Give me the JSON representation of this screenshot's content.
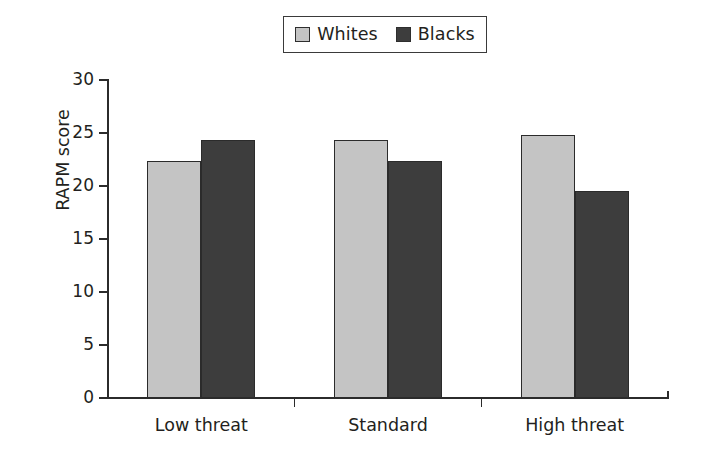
{
  "chart_data": {
    "type": "bar",
    "title": "",
    "xlabel": "",
    "ylabel": "RAPM score",
    "categories": [
      "Low threat",
      "Standard",
      "High threat"
    ],
    "series": [
      {
        "name": "Whites",
        "color": "#c4c4c4",
        "values": [
          22.4,
          24.3,
          24.8
        ]
      },
      {
        "name": "Blacks",
        "color": "#3d3d3d",
        "values": [
          24.3,
          22.4,
          19.5
        ]
      }
    ],
    "ylim": [
      0,
      30
    ],
    "yticks": [
      0,
      5,
      10,
      15,
      20,
      25,
      30
    ],
    "ytick_labels": [
      "0",
      "5",
      "10",
      "15",
      "20",
      "25",
      "30"
    ],
    "grid": false,
    "legend_position": "top-center",
    "legend_entries": [
      "Whites",
      "Blacks"
    ]
  },
  "legend": {
    "items": [
      {
        "label": "Whites",
        "swatch_name": "legend-swatch-whites"
      },
      {
        "label": "Blacks",
        "swatch_name": "legend-swatch-blacks"
      }
    ]
  },
  "axes": {
    "y_title": "RAPM score",
    "y_tick_labels": [
      "30",
      "25",
      "20",
      "15",
      "10",
      "5",
      "0"
    ],
    "x_tick_labels": [
      "Low threat",
      "Standard",
      "High threat"
    ]
  }
}
